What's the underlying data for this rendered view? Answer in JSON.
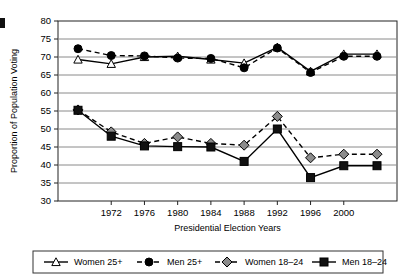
{
  "chart_data": {
    "type": "line",
    "title": "",
    "xlabel": "Presidential Election Years",
    "ylabel": "Proportion of Population Voting",
    "ylim": [
      30,
      80
    ],
    "ytick_step": 5,
    "yticks": [
      "30",
      "35",
      "40",
      "45",
      "50",
      "55",
      "60",
      "65",
      "70",
      "75",
      "80"
    ],
    "grid": true,
    "grid_axis": "y",
    "legend_position": "bottom",
    "categories": [
      "1968",
      "1972",
      "1976",
      "1980",
      "1984",
      "1988",
      "1992",
      "1996",
      "2000",
      "2004"
    ],
    "xtick_labels": [
      "1972",
      "1976",
      "1980",
      "1984",
      "1988",
      "1992",
      "1996",
      "2000"
    ],
    "series": [
      {
        "name": "Women 25+",
        "marker": "open-triangle",
        "line": "solid",
        "color": "#000000",
        "fill": "#ffffff",
        "values": [
          69.3,
          68.1,
          70.0,
          70.2,
          69.3,
          68.3,
          72.7,
          66.0,
          70.8,
          70.8
        ]
      },
      {
        "name": "Men 25+",
        "marker": "filled-circle",
        "line": "dashed",
        "color": "#000000",
        "fill": "#000000",
        "values": [
          72.3,
          70.4,
          70.3,
          69.7,
          69.6,
          67.0,
          72.5,
          65.7,
          70.2,
          70.2
        ]
      },
      {
        "name": "Women 18–24",
        "marker": "filled-diamond",
        "line": "dashed",
        "color": "#000000",
        "fill": "#8c8c8c",
        "values": [
          55.3,
          49.2,
          46.0,
          47.8,
          46.0,
          45.5,
          53.5,
          42.0,
          43.0,
          43.0
        ]
      },
      {
        "name": "Men 18–24",
        "marker": "filled-square",
        "line": "solid",
        "color": "#000000",
        "fill": "#111111",
        "values": [
          55.2,
          48.0,
          45.3,
          45.1,
          45.0,
          41.0,
          50.0,
          36.5,
          39.8,
          39.8
        ]
      }
    ]
  }
}
